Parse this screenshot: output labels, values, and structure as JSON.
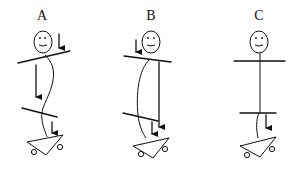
{
  "diagram": {
    "figures": [
      {
        "id": "A",
        "label": "A",
        "posture": "wavy spine, tilted shoulders and hips",
        "arrows": 3
      },
      {
        "id": "B",
        "label": "B",
        "posture": "curved spine, tilted shoulders and hips",
        "arrows": 3
      },
      {
        "id": "C",
        "label": "C",
        "posture": "straight spine, level shoulders and hips",
        "arrows": 1
      }
    ],
    "colors": {
      "stroke": "#111111",
      "background": "#ffffff"
    }
  }
}
